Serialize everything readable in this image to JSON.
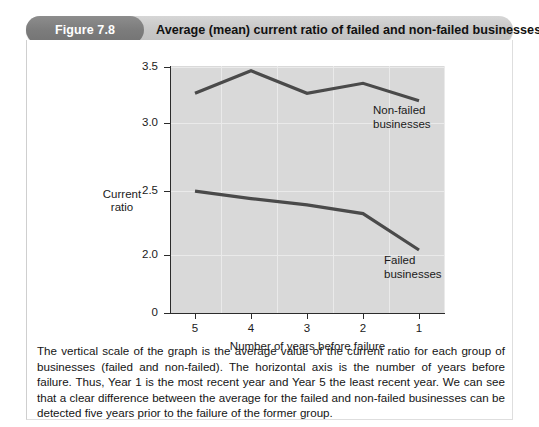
{
  "figure": {
    "badge": "Figure 7.8",
    "title": "Average (mean) current ratio of failed and non-failed businesses",
    "caption": "The vertical scale of the graph is the average value of the current ratio for each group of businesses (failed and non-failed). The horizontal axis is the number of years before failure. Thus, Year 1 is the most recent year and Year 5 the least recent year. We can see that a clear difference between the average for the failed and non-failed businesses can be detected five years prior to the failure of the former group.",
    "badge_color": "#7c7c7c",
    "header_color": "#c8c8c8"
  },
  "chart_data": {
    "type": "line",
    "title": "Average (mean) current ratio of failed and non-failed businesses",
    "xlabel": "Number of years before failure",
    "ylabel": "Current ratio",
    "categories": [
      "5",
      "4",
      "3",
      "2",
      "1"
    ],
    "xticklabels": [
      "5",
      "4",
      "3",
      "2",
      "1"
    ],
    "yticklabels": [
      "3.5",
      "3.0",
      "2.5",
      "2.0",
      "0"
    ],
    "ytickvalues": [
      3.5,
      3.0,
      2.5,
      2.0,
      0
    ],
    "ylim": [
      0,
      3.5
    ],
    "y_axis_broken": true,
    "grid": true,
    "legend_position": "inline-annotation",
    "plot_background": "#d9d9d9",
    "line_color": "#4a4a4a",
    "series": [
      {
        "name": "Non-failed businesses",
        "label": "Non-failed\nbusinesses",
        "label_line1": "Non-failed",
        "label_line2": "businesses",
        "values": [
          3.29,
          3.47,
          3.29,
          3.37,
          3.23
        ]
      },
      {
        "name": "Failed businesses",
        "label": "Failed\nbusinesses",
        "label_line1": "Failed",
        "label_line2": "businesses",
        "values": [
          2.51,
          2.45,
          2.4,
          2.33,
          2.04
        ]
      }
    ]
  }
}
